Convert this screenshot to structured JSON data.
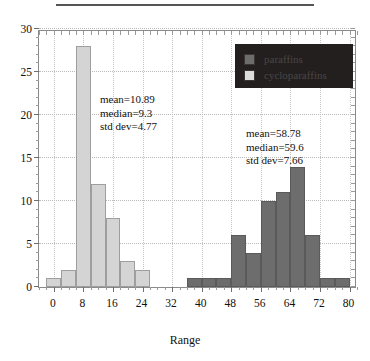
{
  "figure": {
    "top_rule": "divider"
  },
  "chart_data": {
    "type": "bar",
    "title": "",
    "xlabel": "Range",
    "ylabel": "",
    "xlim": [
      -4,
      82
    ],
    "ylim": [
      0,
      30
    ],
    "grid": true,
    "bin_width": 4,
    "x_ticks": [
      0,
      8,
      16,
      24,
      32,
      40,
      48,
      56,
      64,
      72,
      80
    ],
    "x_tick_labels": [
      "0",
      "8",
      "16",
      "24",
      "32",
      "40",
      "48",
      "56",
      "64",
      "72",
      "80"
    ],
    "y_ticks": [
      0,
      5,
      10,
      15,
      20,
      25,
      30
    ],
    "y_tick_labels": [
      "0",
      "5",
      "10",
      "15",
      "20",
      "25",
      "30"
    ],
    "legend_position": "top-right",
    "series": [
      {
        "name": "paraffins",
        "color": "#6d6d6d",
        "bins": [
          {
            "start": 36,
            "end": 40,
            "value": 1
          },
          {
            "start": 40,
            "end": 44,
            "value": 1
          },
          {
            "start": 44,
            "end": 48,
            "value": 1
          },
          {
            "start": 48,
            "end": 52,
            "value": 6
          },
          {
            "start": 52,
            "end": 56,
            "value": 4
          },
          {
            "start": 56,
            "end": 60,
            "value": 10
          },
          {
            "start": 60,
            "end": 64,
            "value": 11
          },
          {
            "start": 64,
            "end": 68,
            "value": 14
          },
          {
            "start": 68,
            "end": 72,
            "value": 6
          },
          {
            "start": 72,
            "end": 76,
            "value": 1
          },
          {
            "start": 76,
            "end": 80,
            "value": 1
          }
        ],
        "stats": {
          "mean": "mean=58.78",
          "median": "median=59.6",
          "std_dev": "std dev=7.66"
        }
      },
      {
        "name": "cycloparaffins",
        "color": "#d4d4d4",
        "bins": [
          {
            "start": -2,
            "end": 2,
            "value": 1
          },
          {
            "start": 2,
            "end": 6,
            "value": 2
          },
          {
            "start": 6,
            "end": 10,
            "value": 28
          },
          {
            "start": 10,
            "end": 14,
            "value": 12
          },
          {
            "start": 14,
            "end": 18,
            "value": 8
          },
          {
            "start": 18,
            "end": 22,
            "value": 3
          },
          {
            "start": 22,
            "end": 26,
            "value": 2
          }
        ],
        "stats": {
          "mean": "mean=10.89",
          "median": "median=9.3",
          "std_dev": "std dev=4.77"
        }
      }
    ]
  },
  "legend": {
    "items": [
      {
        "label": "paraffins",
        "color": "#6d6d6d"
      },
      {
        "label": "cycloparaffins",
        "color": "#dcdcdc"
      }
    ],
    "background": "#231f1f"
  }
}
